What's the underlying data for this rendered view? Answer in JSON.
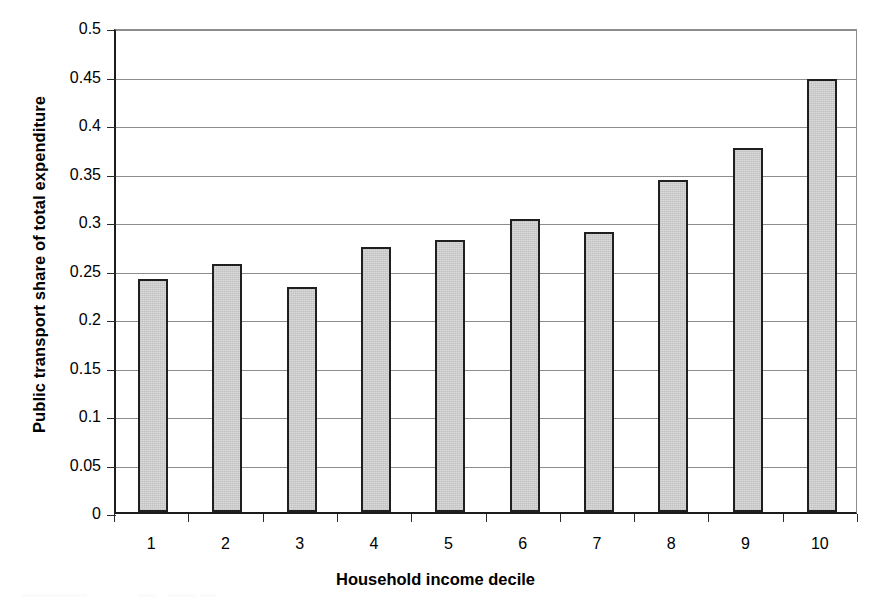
{
  "chart_data": {
    "type": "bar",
    "title": "",
    "xlabel": "Household income decile",
    "ylabel": "Public transport share of total expenditure",
    "categories": [
      "1",
      "2",
      "3",
      "4",
      "5",
      "6",
      "7",
      "8",
      "9",
      "10"
    ],
    "values": [
      0.24,
      0.256,
      0.232,
      0.273,
      0.28,
      0.302,
      0.289,
      0.342,
      0.375,
      0.446
    ],
    "series": [
      {
        "name": "Public transport share of total expenditure",
        "values": [
          0.24,
          0.256,
          0.232,
          0.273,
          0.28,
          0.302,
          0.289,
          0.342,
          0.375,
          0.446
        ]
      }
    ],
    "ylim": [
      0,
      0.5
    ],
    "ytick_labels": [
      "0",
      "0.05",
      "0.1",
      "0.15",
      "0.2",
      "0.25",
      "0.3",
      "0.35",
      "0.4",
      "0.45",
      "0.5"
    ],
    "ytick_values": [
      0,
      0.05,
      0.1,
      0.15,
      0.2,
      0.25,
      0.3,
      0.35,
      0.4,
      0.45,
      0.5
    ],
    "grid": "horizontal",
    "legend": "none",
    "bar_fill_color": "#d6d6d6",
    "bar_border_color": "#1f1f1f",
    "gridline_color": "#8d8d8d",
    "axis_color": "#1c1c1c"
  }
}
